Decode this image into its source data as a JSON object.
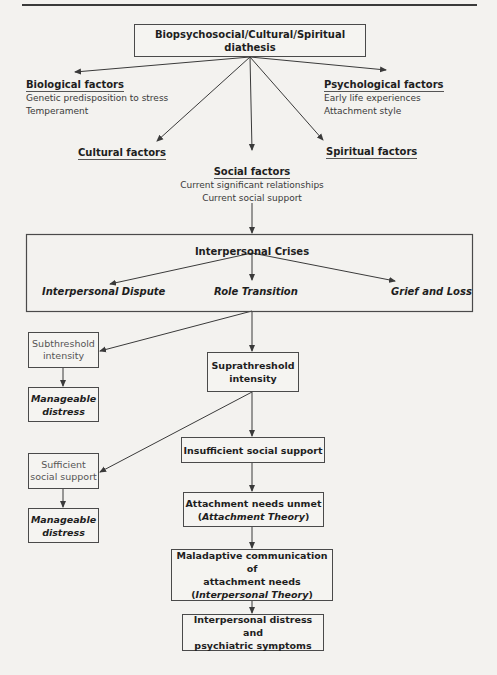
{
  "diathesis": {
    "title": "Biopsychosocial/Cultural/Spiritual diathesis",
    "factors": [
      {
        "id": "biological",
        "heading": "Biological factors",
        "items": [
          "Genetic predisposition to stress",
          "Temperament"
        ]
      },
      {
        "id": "psychological",
        "heading": "Psychological factors",
        "items": [
          "Early life experiences",
          "Attachment style"
        ]
      },
      {
        "id": "cultural",
        "heading": "Cultural factors",
        "items": []
      },
      {
        "id": "spiritual",
        "heading": "Spiritual factors",
        "items": []
      },
      {
        "id": "social",
        "heading": "Social factors",
        "items": [
          "Current significant relationships",
          "Current social support"
        ]
      }
    ]
  },
  "crises": {
    "title": "Interpersonal Crises",
    "types": [
      "Interpersonal Dispute",
      "Role Transition",
      "Grief and Loss"
    ]
  },
  "flow": {
    "subthreshold": [
      "Subthreshold",
      "intensity"
    ],
    "manageable_1": [
      "Manageable",
      "distress"
    ],
    "suprathreshold": [
      "Suprathreshold",
      "intensity"
    ],
    "insufficient_support": "Insufficient social support",
    "sufficient_support": [
      "Sufficient",
      "social support"
    ],
    "manageable_2": [
      "Manageable",
      "distress"
    ],
    "attachment_unmet": {
      "line1": "Attachment needs unmet",
      "theory": "Attachment Theory"
    },
    "maladaptive": {
      "line1": "Maladaptive communication of",
      "line2": "attachment needs",
      "theory": "Interpersonal Theory"
    },
    "outcome": [
      "Interpersonal distress and",
      "psychiatric symptoms"
    ]
  },
  "colors": {
    "background": "#f3f2ef",
    "line": "#3a3a3a",
    "box_border": "#4a4a4a",
    "text": "#1e1e1e"
  }
}
